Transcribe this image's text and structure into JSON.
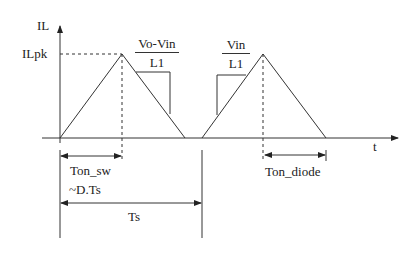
{
  "diagram": {
    "axes": {
      "y_label": "IL",
      "x_label": "t",
      "peak_label": "ILpk"
    },
    "slopes": {
      "falling": {
        "numerator": "Vo-Vin",
        "denominator": "L1"
      },
      "rising": {
        "numerator": "Vin",
        "denominator": "L1"
      }
    },
    "intervals": {
      "ton_sw": "Ton_sw",
      "ton_sw_approx": "~D.Ts",
      "ts": "Ts",
      "ton_diode": "Ton_diode"
    },
    "colors": {
      "line": "#333333",
      "background": "#ffffff"
    }
  }
}
